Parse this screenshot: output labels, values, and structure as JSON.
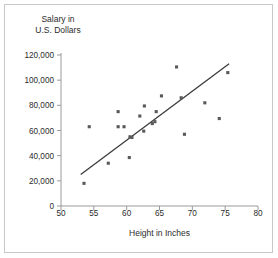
{
  "chart_data": {
    "type": "scatter",
    "title": "",
    "xlabel": "Height in Inches",
    "ylabel_line1": "Salary in",
    "ylabel_line2": "U.S. Dollars",
    "xlim": [
      50,
      80
    ],
    "ylim": [
      0,
      120000
    ],
    "xticks": [
      "50",
      "55",
      "60",
      "65",
      "70",
      "75",
      "80"
    ],
    "xtick_values": [
      50,
      55,
      60,
      65,
      70,
      75,
      80
    ],
    "yticks": [
      "0",
      "20,000",
      "40,000",
      "60,000",
      "80,000",
      "100,000",
      "120,000"
    ],
    "ytick_values": [
      0,
      20000,
      40000,
      60000,
      80000,
      100000,
      120000
    ],
    "grid": false,
    "legend": "none",
    "marker_color": "#595959",
    "line_color": "#3b3b3b",
    "axis_color": "#9a9a9a",
    "points": [
      {
        "x": 53.5,
        "y": 18000
      },
      {
        "x": 54.3,
        "y": 63000
      },
      {
        "x": 57.2,
        "y": 34000
      },
      {
        "x": 58.7,
        "y": 75000
      },
      {
        "x": 58.7,
        "y": 63000
      },
      {
        "x": 59.6,
        "y": 63000
      },
      {
        "x": 60.4,
        "y": 38500
      },
      {
        "x": 60.5,
        "y": 55000
      },
      {
        "x": 60.8,
        "y": 54500
      },
      {
        "x": 62.0,
        "y": 71500
      },
      {
        "x": 62.6,
        "y": 59500
      },
      {
        "x": 62.7,
        "y": 79500
      },
      {
        "x": 63.9,
        "y": 65500
      },
      {
        "x": 64.3,
        "y": 67000
      },
      {
        "x": 64.5,
        "y": 75000
      },
      {
        "x": 65.3,
        "y": 87500
      },
      {
        "x": 67.6,
        "y": 110500
      },
      {
        "x": 68.3,
        "y": 86000
      },
      {
        "x": 68.8,
        "y": 57000
      },
      {
        "x": 71.9,
        "y": 82000
      },
      {
        "x": 74.1,
        "y": 69500
      },
      {
        "x": 75.4,
        "y": 106000
      }
    ],
    "trendline": {
      "x_start": 53.0,
      "y_start": 25000,
      "x_end": 75.6,
      "y_end": 113000
    }
  }
}
